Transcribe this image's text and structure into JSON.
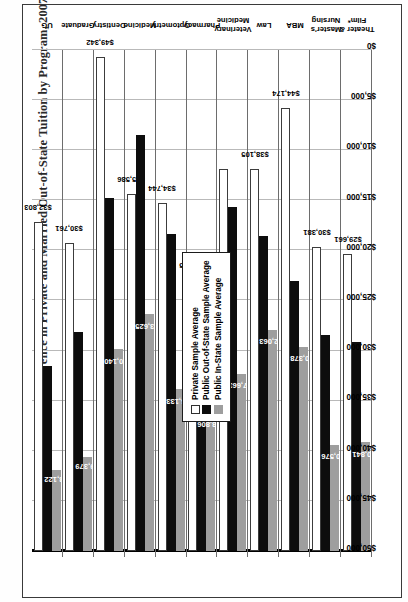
{
  "title": "Difference in Private and Married Out-of-State Tuition by Program, 2007 Rates",
  "legend": {
    "items": [
      {
        "label": "Private Sample Average",
        "swatch": "private",
        "color": "#ffffff"
      },
      {
        "label": "Public Out-of-State Sample Average",
        "swatch": "outstate",
        "color": "#0d0d0d"
      },
      {
        "label": "Public In-State Sample Average",
        "swatch": "instate",
        "color": "#9e9e9e"
      }
    ]
  },
  "axis": {
    "ticks": [
      "$50,000",
      "$45,000",
      "$40,000",
      "$35,000",
      "$30,000",
      "$25,000",
      "$20,000",
      "$15,000",
      "$10,000",
      "$5,000",
      "$0"
    ]
  },
  "chart_data": {
    "type": "bar",
    "orientation": "horizontal",
    "title": "Difference in Private and Married Out-of-State Tuition by Program, 2007 Rates",
    "xlabel": "",
    "ylabel": "",
    "xlim": [
      0,
      50000
    ],
    "xticks": [
      0,
      5000,
      10000,
      15000,
      20000,
      25000,
      30000,
      35000,
      40000,
      45000,
      50000
    ],
    "grid": true,
    "legend_position": "center-left",
    "categories": [
      "UG",
      "Graduate",
      "Dentistry",
      "Medicine",
      "Optometry",
      "Pharmacy",
      "Veterinary Medicine",
      "Law",
      "MBA",
      "Master's Nursing",
      "Theater & Film*"
    ],
    "series": [
      {
        "name": "Private Sample Average",
        "color": "#ffffff",
        "values": [
          32803,
          30761,
          49342,
          35586,
          34744,
          27015,
          38105,
          38105,
          44174,
          30381,
          29661
        ],
        "labels": [
          "$32,803",
          "$30,761",
          "$49,342",
          "$35,586",
          "$34,744",
          "$27,015",
          "$38,105",
          "$38,105",
          "$44,174",
          "$30,381",
          "$29,661"
        ]
      },
      {
        "name": "Public Out-of-State Sample Average",
        "color": "#0d0d0d",
        "values": [
          18450,
          21900,
          35200,
          41500,
          31600,
          26500,
          34300,
          31400,
          26900,
          21600,
          20900
        ],
        "labels": [
          "",
          "",
          "",
          "",
          "",
          "",
          "",
          "",
          "",
          "",
          ""
        ]
      },
      {
        "name": "Public In-State Sample Average",
        "color": "#9e9e9e",
        "values": [
          8122,
          9379,
          20140,
          23625,
          16133,
          13806,
          17663,
          22063,
          20378,
          10576,
          10841
        ],
        "labels": [
          "$8,122",
          "$9,379",
          "$20,140",
          "$23,625",
          "$16,133",
          "$13,806",
          "$17,663",
          "$22,063",
          "$20,378",
          "$10,576",
          "$10,841"
        ]
      }
    ],
    "rows": [
      {
        "category": "UG",
        "private": 32803,
        "private_label": "$32,803",
        "outstate": 18450,
        "outstate_label": "",
        "instate": 8122,
        "instate_label": "$8,122"
      },
      {
        "category": "Graduate",
        "private": 30761,
        "private_label": "$30,761",
        "outstate": 21900,
        "outstate_label": "",
        "instate": 9379,
        "instate_label": "$9,379"
      },
      {
        "category": "Dentistry",
        "private": 49342,
        "private_label": "$49,342",
        "outstate": 35200,
        "outstate_label": "",
        "instate": 20140,
        "instate_label": "$20,140"
      },
      {
        "category": "Medicine",
        "private": 35586,
        "private_label": "$35,586",
        "outstate": 41500,
        "outstate_label": "",
        "instate": 23625,
        "instate_label": "$23,625"
      },
      {
        "category": "Optometry",
        "private": 34744,
        "private_label": "$34,744",
        "outstate": 31600,
        "outstate_label": "",
        "instate": 16133,
        "instate_label": "$16,133"
      },
      {
        "category": "Pharmacy",
        "private": 27015,
        "private_label": "$27,015",
        "outstate": 26500,
        "outstate_label": "",
        "instate": 13806,
        "instate_label": "$13,806"
      },
      {
        "category": "Veterinary Medicine",
        "private": 38105,
        "private_label": "",
        "outstate": 34300,
        "outstate_label": "",
        "instate": 17663,
        "instate_label": "$17,663"
      },
      {
        "category": "Law",
        "private": 38105,
        "private_label": "$38,105",
        "outstate": 31400,
        "outstate_label": "",
        "instate": 22063,
        "instate_label": "$22,063"
      },
      {
        "category": "MBA",
        "private": 44174,
        "private_label": "$44,174",
        "outstate": 26900,
        "outstate_label": "",
        "instate": 20378,
        "instate_label": "$20,378"
      },
      {
        "category": "Master's Nursing",
        "private": 30381,
        "private_label": "$30,381",
        "outstate": 21600,
        "outstate_label": "",
        "instate": 10576,
        "instate_label": "$10,576"
      },
      {
        "category": "Theater & Film*",
        "private": 29661,
        "private_label": "$29,661",
        "outstate": 20900,
        "outstate_label": "",
        "instate": 10841,
        "instate_label": "$10,841"
      }
    ]
  }
}
